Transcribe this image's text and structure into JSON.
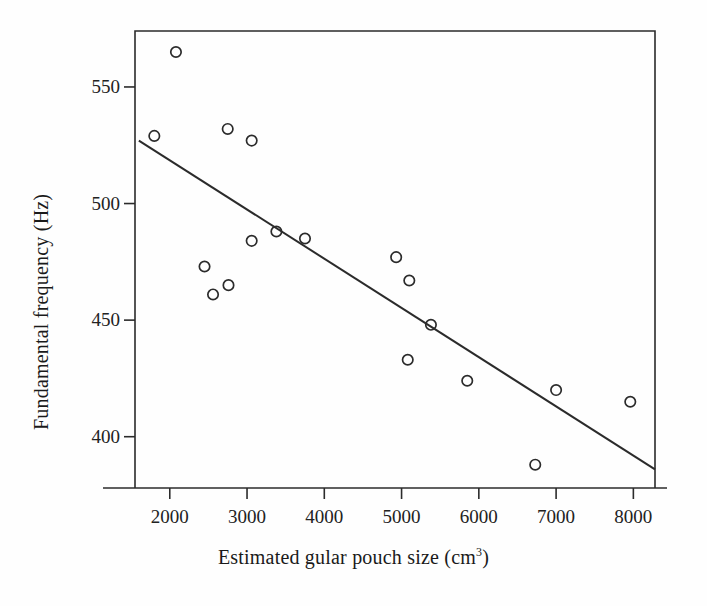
{
  "figure": {
    "type": "scatter-with-regression",
    "background_color": "#fefefe",
    "ink_color": "#2b2b2b"
  },
  "axes": {
    "x_title_prefix": "Estimated gular pouch size (cm",
    "x_title_superscript": "3",
    "x_title_suffix": ")",
    "y_title": "Fundamental frequency (Hz)",
    "x_ticks": [
      "2000",
      "3000",
      "4000",
      "5000",
      "6000",
      "7000",
      "8000"
    ],
    "y_ticks": [
      "400",
      "450",
      "500",
      "550"
    ]
  },
  "chart_data": {
    "type": "scatter",
    "title": "",
    "xlabel": "Estimated gular pouch size (cm^3)",
    "ylabel": "Fundamental frequency (Hz)",
    "xlim": [
      1550,
      8280
    ],
    "ylim": [
      378,
      574
    ],
    "xticks": [
      2000,
      3000,
      4000,
      5000,
      6000,
      7000,
      8000
    ],
    "yticks": [
      400,
      450,
      500,
      550
    ],
    "grid": false,
    "legend": false,
    "marker": "open-circle",
    "points": [
      {
        "x": 2080,
        "y": 565
      },
      {
        "x": 1800,
        "y": 529
      },
      {
        "x": 2750,
        "y": 532
      },
      {
        "x": 3060,
        "y": 527
      },
      {
        "x": 3380,
        "y": 488
      },
      {
        "x": 3060,
        "y": 484
      },
      {
        "x": 3750,
        "y": 485
      },
      {
        "x": 2450,
        "y": 473
      },
      {
        "x": 2760,
        "y": 465
      },
      {
        "x": 2560,
        "y": 461
      },
      {
        "x": 4930,
        "y": 477
      },
      {
        "x": 5100,
        "y": 467
      },
      {
        "x": 5380,
        "y": 448
      },
      {
        "x": 5080,
        "y": 433
      },
      {
        "x": 5850,
        "y": 424
      },
      {
        "x": 7000,
        "y": 420
      },
      {
        "x": 7960,
        "y": 415
      },
      {
        "x": 6730,
        "y": 388
      }
    ],
    "regression_line": {
      "x_start": 1600,
      "y_start": 527,
      "x_end": 8280,
      "y_end": 386
    }
  }
}
